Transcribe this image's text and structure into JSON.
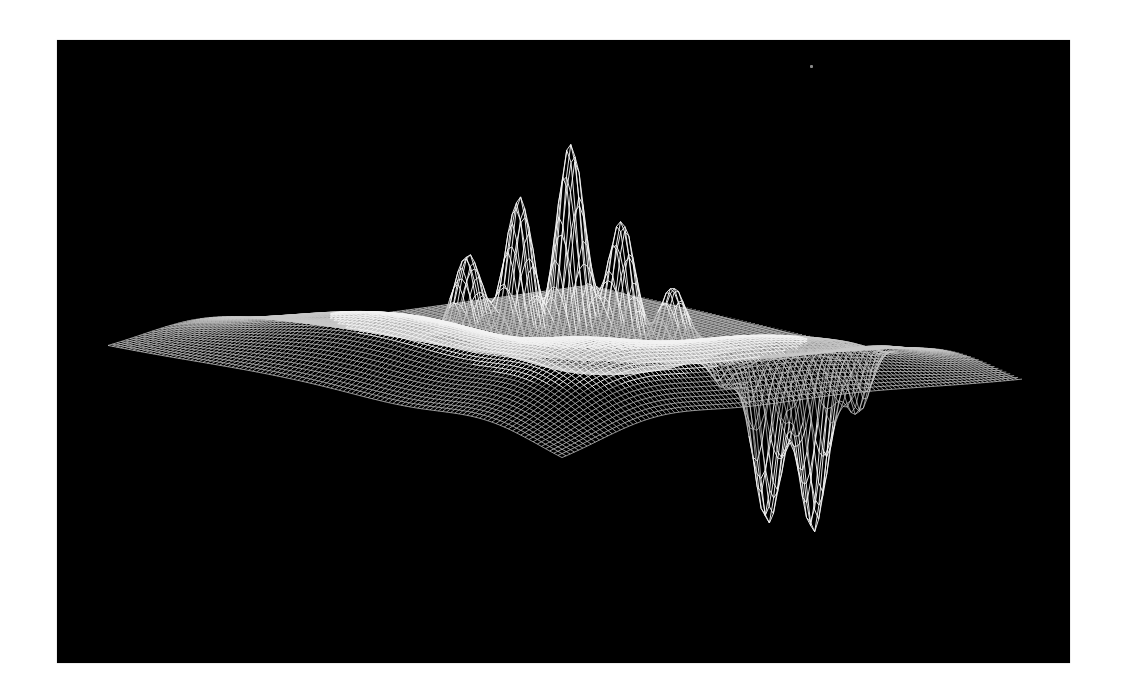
{
  "figure": {
    "description": "3D wireframe surface plot on black background",
    "background_color": "#000000",
    "frame_color": "#ffffff",
    "wire_color": "#c8c8c8",
    "highlight_color": "#f2f2f2",
    "speck": {
      "x": 753,
      "y": 25
    }
  },
  "chart_data": {
    "type": "surface",
    "title": "",
    "xlabel": "",
    "ylabel": "",
    "zlabel": "",
    "grid": false,
    "legend": null,
    "mesh": {
      "nu": 110,
      "nv": 110,
      "range": [
        -1,
        1
      ]
    },
    "projection": {
      "corner_left": [
        51,
        311
      ],
      "corner_front": [
        505,
        430
      ],
      "corner_right": [
        965,
        346
      ],
      "corner_back": [
        533,
        245
      ],
      "z_scale": 1.0
    },
    "components": [
      {
        "kind": "ridge",
        "u": -0.55,
        "v": 0.0,
        "su": 0.22,
        "sv": 0.55,
        "amp": 75,
        "note": "left broad hill"
      },
      {
        "kind": "ridge",
        "u": 0.0,
        "v": 0.62,
        "su": 0.55,
        "sv": 0.2,
        "amp": 70,
        "note": "right broad hill"
      },
      {
        "kind": "spike",
        "u": 0.02,
        "v": -0.02,
        "su": 0.035,
        "sv": 0.05,
        "amp": 225,
        "note": "central tallest peak"
      },
      {
        "kind": "spike",
        "u": -0.1,
        "v": -0.1,
        "su": 0.035,
        "sv": 0.05,
        "amp": 165,
        "note": "left peak"
      },
      {
        "kind": "spike",
        "u": 0.12,
        "v": 0.08,
        "su": 0.035,
        "sv": 0.05,
        "amp": 150,
        "note": "right peak"
      },
      {
        "kind": "spike",
        "u": -0.2,
        "v": -0.2,
        "su": 0.035,
        "sv": 0.05,
        "amp": 95,
        "note": "far-left small peak"
      },
      {
        "kind": "spike",
        "u": 0.22,
        "v": 0.18,
        "su": 0.035,
        "sv": 0.05,
        "amp": 80,
        "note": "far-right small peak"
      },
      {
        "kind": "spike",
        "u": 0.3,
        "v": 0.28,
        "su": 0.05,
        "sv": 0.06,
        "amp": 25,
        "note": "tiny bump"
      },
      {
        "kind": "spike",
        "u": 0.42,
        "v": 0.36,
        "su": 0.035,
        "sv": 0.05,
        "amp": -170,
        "note": "downward spike 1"
      },
      {
        "kind": "spike",
        "u": 0.52,
        "v": 0.44,
        "su": 0.035,
        "sv": 0.05,
        "amp": -185,
        "note": "downward spike 2"
      },
      {
        "kind": "spike",
        "u": 0.34,
        "v": 0.26,
        "su": 0.03,
        "sv": 0.04,
        "amp": -40,
        "note": "downward small left"
      },
      {
        "kind": "spike",
        "u": 0.58,
        "v": 0.56,
        "su": 0.03,
        "sv": 0.045,
        "amp": -70,
        "note": "downward small right"
      }
    ]
  }
}
